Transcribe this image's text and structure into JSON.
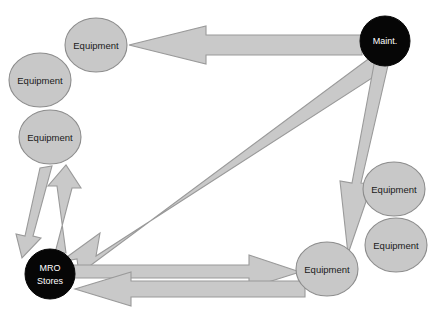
{
  "diagram": {
    "background_color": "#ffffff",
    "node_fill_light": "#c8c8c8",
    "node_stroke_light": "#8c8c8c",
    "node_fill_dark": "#060606",
    "node_label_color_light": "#1a1a1a",
    "node_label_color_dark": "#ffffff",
    "arrow_fill": "#c9c9c9",
    "arrow_stroke": "#9a9a9a",
    "nodes": [
      {
        "id": "equipment-top",
        "label": "Equipment",
        "type": "light",
        "cx": 96,
        "cy": 45,
        "rx": 31,
        "ry": 27
      },
      {
        "id": "equipment-upper-left",
        "label": "Equipment",
        "type": "light",
        "cx": 40,
        "cy": 80,
        "rx": 31,
        "ry": 27
      },
      {
        "id": "equipment-mid-left",
        "label": "Equipment",
        "type": "light",
        "cx": 50,
        "cy": 137,
        "rx": 31,
        "ry": 27
      },
      {
        "id": "mro-stores",
        "label": "MRO Stores",
        "label_line1": "MRO",
        "label_line2": "Stores",
        "type": "dark",
        "cx": 50,
        "cy": 274,
        "rx": 25,
        "ry": 25
      },
      {
        "id": "maintenance",
        "label": "Maint.",
        "type": "dark",
        "cx": 385,
        "cy": 41,
        "rx": 25,
        "ry": 25
      },
      {
        "id": "equipment-right-upper",
        "label": "Equipment",
        "type": "light",
        "cx": 394,
        "cy": 189,
        "rx": 31,
        "ry": 27
      },
      {
        "id": "equipment-right-lower",
        "label": "Equipment",
        "type": "light",
        "cx": 396,
        "cy": 245,
        "rx": 31,
        "ry": 27
      },
      {
        "id": "equipment-bottom",
        "label": "Equipment",
        "type": "light",
        "cx": 327,
        "cy": 269,
        "rx": 31,
        "ry": 27
      }
    ],
    "edges": [
      {
        "id": "maint-to-equipment-top",
        "from": "maintenance",
        "to": "equipment-top",
        "direction": "right-to-left",
        "points": "362,35 206,35 206,26 129,45 206,64 206,55 362,55"
      },
      {
        "id": "maint-to-mro-stores",
        "from": "maintenance",
        "to": "mro-stores",
        "direction": "diagonal-down-left",
        "points": "371,57 383,71 96,256 100,233 60,262 77,259 79,274"
      },
      {
        "id": "maint-to-equipment-bottom",
        "from": "maintenance",
        "to": "equipment-bottom",
        "direction": "top-to-bottom",
        "points": "375,59 389,61 361,183 372,184 348,254 340,181 352,183"
      },
      {
        "id": "equipment-mid-left-to-mro-stores",
        "from": "equipment-mid-left",
        "to": "mro-stores",
        "direction": "down-left",
        "points": "40,168 52,166 33,236 41,238 22,258 16,234 25,236"
      },
      {
        "id": "mro-stores-to-equipment-mid-left",
        "from": "mro-stores",
        "to": "equipment-mid-left",
        "direction": "up-right",
        "points": "55,253 66,253 57,186 48,186 66,165 81,188 72,188"
      },
      {
        "id": "mro-stores-to-equipment-bottom",
        "from": "mro-stores",
        "to": "equipment-bottom",
        "direction": "left-to-right",
        "points": "74,265 249,265 249,255 300,272 249,288 249,278 74,278"
      },
      {
        "id": "equipment-bottom-to-mro-stores",
        "from": "equipment-bottom",
        "to": "mro-stores",
        "direction": "right-to-left",
        "points": "305,281 131,281 131,272 75,289 131,306 131,297 305,297"
      }
    ]
  }
}
